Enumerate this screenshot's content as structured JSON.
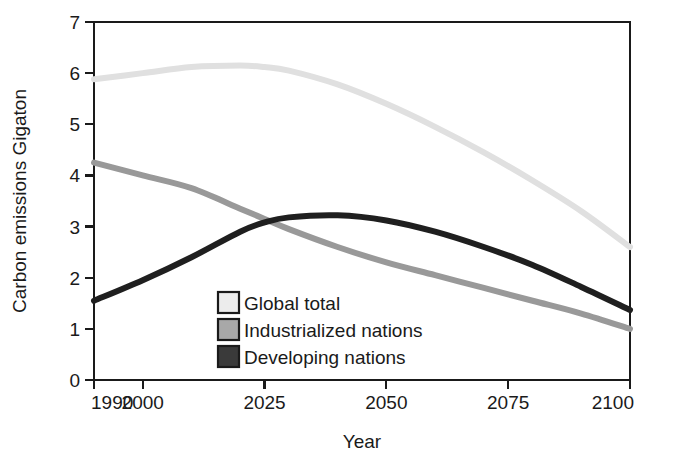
{
  "chart_data": {
    "type": "line",
    "title": "",
    "xlabel": "Year",
    "ylabel": "Carbon emissions Gigaton",
    "xlim": [
      1990,
      2100
    ],
    "ylim": [
      0,
      7
    ],
    "grid": false,
    "legend_position": "inside-bottom-center",
    "xticks": [
      1990,
      2000,
      2025,
      2050,
      2075,
      2100
    ],
    "xtick_labels": [
      "1990",
      "2000",
      "2025",
      "2050",
      "2075",
      "2100"
    ],
    "yticks": [
      0,
      1,
      2,
      3,
      4,
      5,
      6,
      7
    ],
    "ytick_labels": [
      "0",
      "1",
      "2",
      "3",
      "4",
      "5",
      "6",
      "7"
    ],
    "x": [
      1990,
      2000,
      2010,
      2020,
      2025,
      2030,
      2040,
      2050,
      2060,
      2070,
      2080,
      2090,
      2100
    ],
    "series": [
      {
        "name": "Global total",
        "color": "#e0e0e0",
        "swatch_color": "#ececec",
        "line_width": 6,
        "values": [
          5.88,
          6.0,
          6.12,
          6.15,
          6.12,
          6.05,
          5.78,
          5.4,
          4.95,
          4.45,
          3.9,
          3.3,
          2.6
        ]
      },
      {
        "name": "Industrialized nations",
        "color": "#999999",
        "swatch_color": "#a8a8a8",
        "line_width": 6,
        "values": [
          4.25,
          4.0,
          3.75,
          3.35,
          3.15,
          2.95,
          2.6,
          2.3,
          2.05,
          1.8,
          1.55,
          1.3,
          1.0
        ]
      },
      {
        "name": "Developing nations",
        "color": "#1f1f1f",
        "swatch_color": "#3a3a3a",
        "line_width": 6,
        "values": [
          1.55,
          1.95,
          2.4,
          2.9,
          3.08,
          3.18,
          3.22,
          3.12,
          2.9,
          2.6,
          2.25,
          1.82,
          1.37
        ]
      }
    ],
    "annotations": []
  }
}
